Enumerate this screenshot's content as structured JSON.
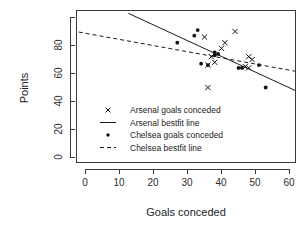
{
  "chart_data": {
    "type": "scatter",
    "title": "",
    "xlabel": "Goals conceded",
    "ylabel": "Points",
    "xlim": [
      -4,
      62
    ],
    "ylim": [
      -6,
      103
    ],
    "xticks": [
      0,
      10,
      20,
      30,
      40,
      50,
      60
    ],
    "yticks": [
      0,
      20,
      40,
      60,
      80,
      100
    ],
    "ytick_labels": [
      "0",
      "20",
      "40",
      "60",
      "80",
      ""
    ],
    "grid": false,
    "legend_position": "center-left",
    "series": [
      {
        "name": "Arsenal goals conceded",
        "marker": "cross",
        "points": [
          {
            "x": 36,
            "y": 50
          },
          {
            "x": 36,
            "y": 66
          },
          {
            "x": 37,
            "y": 72
          },
          {
            "x": 38,
            "y": 68
          },
          {
            "x": 35,
            "y": 86
          },
          {
            "x": 41,
            "y": 82
          },
          {
            "x": 40,
            "y": 78
          },
          {
            "x": 44,
            "y": 90
          },
          {
            "x": 48,
            "y": 72
          },
          {
            "x": 49,
            "y": 70
          },
          {
            "x": 47,
            "y": 65
          },
          {
            "x": 48,
            "y": 64
          }
        ]
      },
      {
        "name": "Chelsea goals conceded",
        "marker": "dot",
        "points": [
          {
            "x": 27,
            "y": 82
          },
          {
            "x": 32,
            "y": 87
          },
          {
            "x": 33,
            "y": 91
          },
          {
            "x": 34,
            "y": 67
          },
          {
            "x": 38,
            "y": 75
          },
          {
            "x": 38,
            "y": 73
          },
          {
            "x": 39,
            "y": 74
          },
          {
            "x": 36,
            "y": 66
          },
          {
            "x": 45,
            "y": 64
          },
          {
            "x": 46,
            "y": 64
          },
          {
            "x": 51,
            "y": 66
          },
          {
            "x": 53,
            "y": 50
          }
        ]
      }
    ],
    "fit_lines": [
      {
        "name": "Arsenal bestfit line",
        "style": "solid",
        "x1": 12.6,
        "y1": 103,
        "x2": 62,
        "y2": 47.5
      },
      {
        "name": "Chelsea bestfit line",
        "style": "dashed",
        "x1": -4,
        "y1": 90.5,
        "x2": 62,
        "y2": 61.5
      }
    ]
  },
  "legend": {
    "items": [
      {
        "label": "Arsenal goals conceded",
        "glyph": "cross-marker"
      },
      {
        "label": "Arsenal bestfit line",
        "glyph": "solid-line"
      },
      {
        "label": "Chelsea goals conceded",
        "glyph": "dot-marker"
      },
      {
        "label": "Chelsea bestfit line",
        "glyph": "dashed-line"
      }
    ]
  },
  "axes": {
    "x_title": "Goals conceded",
    "y_title": "Points",
    "x_tick_0": "0",
    "x_tick_1": "10",
    "x_tick_2": "20",
    "x_tick_3": "30",
    "x_tick_4": "40",
    "x_tick_5": "50",
    "x_tick_6": "60",
    "y_tick_0": "0",
    "y_tick_1": "20",
    "y_tick_2": "40",
    "y_tick_3": "60",
    "y_tick_4": "80"
  },
  "colors": {
    "foreground": "#1a1a1a",
    "axis": "#3a3a3a",
    "background": "#ffffff"
  }
}
